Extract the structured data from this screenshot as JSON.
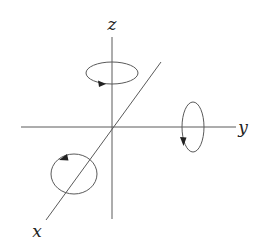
{
  "diagram": {
    "colors": {
      "line": "#5a5a5a",
      "arrow": "#222222",
      "label": "#222222",
      "background": "#ffffff"
    },
    "origin": {
      "x": 112,
      "y": 127
    },
    "axes": [
      {
        "name": "x",
        "label": "x",
        "from": [
          161,
          62
        ],
        "to": [
          46,
          220
        ],
        "label_pos": [
          37,
          236
        ]
      },
      {
        "name": "y",
        "label": "y",
        "from": [
          21,
          127
        ],
        "to": [
          236,
          127
        ],
        "label_pos": [
          243,
          133
        ]
      },
      {
        "name": "z",
        "label": "z",
        "from": [
          112,
          37
        ],
        "to": [
          112,
          219
        ],
        "label_pos": [
          112,
          30
        ]
      }
    ],
    "rotations": [
      {
        "axis": "z",
        "center": [
          112,
          73
        ],
        "rx": 26,
        "ry": 11,
        "arrow_at": [
          101,
          84
        ],
        "arrow_direction": "right"
      },
      {
        "axis": "y",
        "center": [
          193,
          127
        ],
        "rx": 11,
        "ry": 25,
        "arrow_at": [
          183,
          141
        ],
        "arrow_direction": "down"
      },
      {
        "axis": "x",
        "center": [
          74,
          174
        ],
        "rx": 23,
        "ry": 20,
        "arrow_at": [
          62,
          158
        ],
        "arrow_direction": "left"
      }
    ]
  }
}
